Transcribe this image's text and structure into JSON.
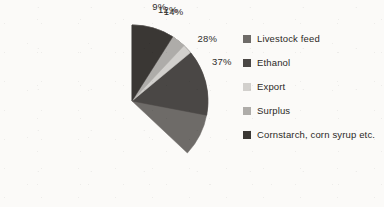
{
  "chart_data": {
    "type": "pie",
    "title": "",
    "categories": [
      "Livestock feed",
      "Ethanol",
      "Export",
      "Surplus",
      "Cornstarch, corn syrup etc."
    ],
    "values": [
      37,
      28,
      14,
      12,
      9
    ],
    "value_labels": [
      "37%",
      "28%",
      "14%",
      "12%",
      "9%"
    ],
    "unit": "%",
    "total": 100,
    "start_angle_deg": 0,
    "direction": "clockwise",
    "legend_position": "right",
    "grid": false,
    "colors": [
      "#6e6b68",
      "#4a4745",
      "#d2d0cd",
      "#aeaca9",
      "#3a3734"
    ],
    "slices": [
      {
        "label": "Livestock feed",
        "value": 37,
        "value_label": "37%",
        "color": "#6e6b68"
      },
      {
        "label": "Ethanol",
        "value": 28,
        "value_label": "28%",
        "color": "#4a4745"
      },
      {
        "label": "Export",
        "value": 14,
        "value_label": "14%",
        "color": "#d2d0cd"
      },
      {
        "label": "Surplus",
        "value": 12,
        "value_label": "12%",
        "color": "#aeaca9"
      },
      {
        "label": "Cornstarch, corn syrup etc.",
        "value": 9,
        "value_label": "9%",
        "color": "#3a3734"
      }
    ]
  },
  "legend": {
    "items": [
      {
        "label": "Livestock feed",
        "color": "#6e6b68"
      },
      {
        "label": "Ethanol",
        "color": "#4a4745"
      },
      {
        "label": "Export",
        "color": "#d2d0cd"
      },
      {
        "label": "Surplus",
        "color": "#aeaca9"
      },
      {
        "label": "Cornstarch, corn syrup etc.",
        "color": "#3a3734"
      }
    ]
  },
  "background_color": "#fbfaf8",
  "text_color": "#2b2926"
}
